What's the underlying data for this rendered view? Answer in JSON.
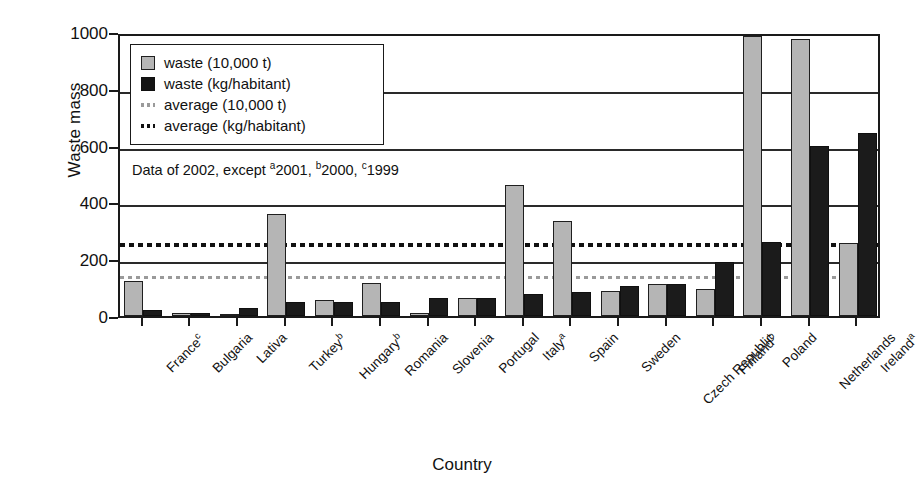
{
  "chart_data": {
    "type": "bar",
    "title": "",
    "xlabel": "Country",
    "ylabel": "Waste mass",
    "ylim": [
      0,
      1000
    ],
    "ytick_step": 200,
    "yticks": [
      0,
      200,
      400,
      600,
      800,
      1000
    ],
    "grid": true,
    "legend_position": "top-left",
    "categories": [
      "France",
      "Bulgaria",
      "Lativa",
      "Turkey",
      "Hungary",
      "Romania",
      "Slovenia",
      "Portugal",
      "Italy",
      "Spain",
      "Sweden",
      "Czech Republic",
      "Finland",
      "Poland",
      "Netherlands",
      "Ireland"
    ],
    "category_footnotes": [
      "c",
      "",
      "",
      "b",
      "b",
      "",
      "",
      "",
      "a",
      "",
      "",
      "",
      "b",
      "",
      "",
      "a"
    ],
    "series": [
      {
        "name": "waste (10,000 t)",
        "color": "#b5b5b5",
        "values": [
          125,
          12,
          5,
          360,
          58,
          118,
          10,
          65,
          462,
          335,
          88,
          112,
          95,
          985,
          975,
          258
        ]
      },
      {
        "name": "waste (kg/habitant)",
        "color": "#1b1b1b",
        "values": [
          20,
          10,
          28,
          50,
          48,
          50,
          62,
          63,
          78,
          85,
          105,
          112,
          190,
          260,
          598,
          645
        ]
      }
    ],
    "reference_lines": [
      {
        "name": "average (10,000 t)",
        "value": 148,
        "color": "#9a9a9a",
        "style": "dotted"
      },
      {
        "name": "average (kg/habitant)",
        "value": 263,
        "color": "#111111",
        "style": "dotted"
      }
    ],
    "annotations": [
      {
        "id": "data-year-note",
        "prefix": "Data of 2002, except ",
        "parts": [
          {
            "sup": "a",
            "text": "2001, "
          },
          {
            "sup": "b",
            "text": "2000, "
          },
          {
            "sup": "c",
            "text": "1999"
          }
        ]
      }
    ]
  },
  "legend": {
    "items": [
      {
        "label": "waste (10,000 t)",
        "swatch": "gray"
      },
      {
        "label": "waste (kg/habitant)",
        "swatch": "black"
      },
      {
        "label": "average (10,000 t)",
        "swatch": "dots-light"
      },
      {
        "label": "average (kg/habitant)",
        "swatch": "dots-dark"
      }
    ]
  }
}
